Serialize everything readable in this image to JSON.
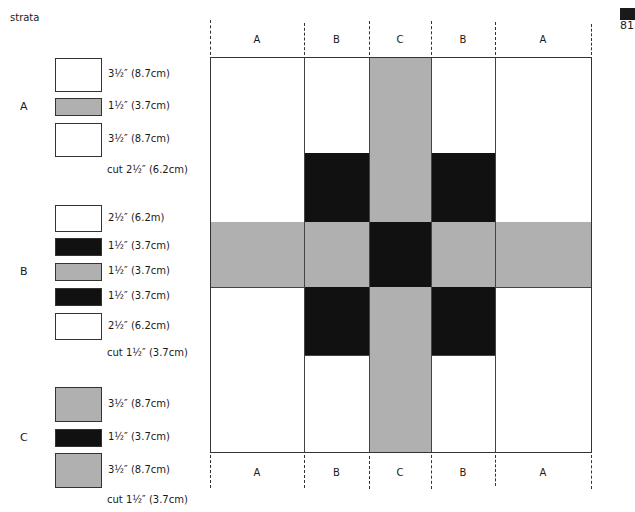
{
  "colors": {
    "white": "#ffffff",
    "gray": "#b0b0b0",
    "black": "#111111",
    "line": "#333333"
  },
  "title": "strata",
  "page_number": "81",
  "strata": [
    {
      "letter": "A",
      "strips": [
        {
          "color": "white",
          "label": "3½″ (8.7cm)"
        },
        {
          "color": "gray",
          "label": "1½″ (3.7cm)"
        },
        {
          "color": "white",
          "label": "3½″ (8.7cm)"
        }
      ],
      "cut": "cut 2½″ (6.2cm)"
    },
    {
      "letter": "B",
      "strips": [
        {
          "color": "white",
          "label": "2½″ (6.2m)"
        },
        {
          "color": "black",
          "label": "1½″ (3.7cm)"
        },
        {
          "color": "gray",
          "label": "1½″ (3.7cm)"
        },
        {
          "color": "black",
          "label": "1½″ (3.7cm)"
        },
        {
          "color": "white",
          "label": "2½″ (6.2cm)"
        }
      ],
      "cut": "cut 1½″ (3.7cm)"
    },
    {
      "letter": "C",
      "strips": [
        {
          "color": "gray",
          "label": "3½″ (8.7cm)"
        },
        {
          "color": "black",
          "label": "1½″ (3.7cm)"
        },
        {
          "color": "gray",
          "label": "3½″ (8.7cm)"
        }
      ],
      "cut": "cut 1½″ (3.7cm)"
    }
  ],
  "block": {
    "top_labels": [
      "A",
      "B",
      "C",
      "B",
      "A"
    ],
    "bottom_labels": [
      "A",
      "B",
      "C",
      "B",
      "A"
    ],
    "columns": [
      {
        "strata": "A",
        "rows": [
          "white",
          "gray",
          "white"
        ]
      },
      {
        "strata": "B",
        "rows": [
          "white",
          "black",
          "gray",
          "black",
          "white"
        ]
      },
      {
        "strata": "C",
        "rows": [
          "gray",
          "black",
          "gray"
        ]
      },
      {
        "strata": "B",
        "rows": [
          "white",
          "black",
          "gray",
          "black",
          "white"
        ]
      },
      {
        "strata": "A",
        "rows": [
          "white",
          "gray",
          "white"
        ]
      }
    ]
  }
}
